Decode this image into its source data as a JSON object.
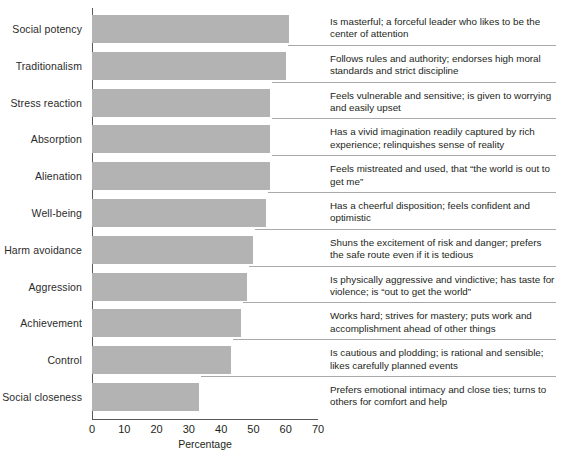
{
  "chart_data": {
    "type": "bar",
    "orientation": "horizontal",
    "title": "",
    "xlabel": "Percentage",
    "ylabel": "",
    "xlim": [
      0,
      70
    ],
    "xticks": [
      0,
      10,
      20,
      30,
      40,
      50,
      60,
      70
    ],
    "grid": false,
    "legend": null,
    "bar_color": "#b3b3b3",
    "axis_color": "#58595b",
    "separator_color": "#a7a9ac",
    "categories": [
      "Social potency",
      "Traditionalism",
      "Stress reaction",
      "Absorption",
      "Alienation",
      "Well-being",
      "Harm avoidance",
      "Aggression",
      "Achievement",
      "Control",
      "Social closeness"
    ],
    "values": [
      61,
      60,
      55,
      55,
      55,
      54,
      50,
      48,
      46,
      43,
      33
    ],
    "descriptions": [
      "Is masterful; a forceful leader who likes to be the center of attention",
      "Follows rules and authority; endorses high moral standards and strict discipline",
      "Feels vulnerable and sensitive; is given to worrying and easily upset",
      "Has a vivid imagination readily captured by rich experience; relinquishes sense of reality",
      "Feels mistreated and used, that “the world is out to get me”",
      "Has a cheerful disposition; feels confident and optimistic",
      "Shuns the excitement of risk and danger; prefers the safe route even if it is tedious",
      "Is physically aggressive and vindictive; has taste for violence; is “out to get the world”",
      "Works hard; strives for mastery; puts work and accomplishment ahead of other things",
      "Is cautious and plodding; is rational and sensible; likes carefully planned events",
      "Prefers emotional intimacy and close ties; turns to others for comfort and help"
    ]
  },
  "axis": {
    "tick_labels": [
      "0",
      "10",
      "20",
      "30",
      "40",
      "50",
      "60",
      "70"
    ],
    "x_title": "Percentage"
  }
}
